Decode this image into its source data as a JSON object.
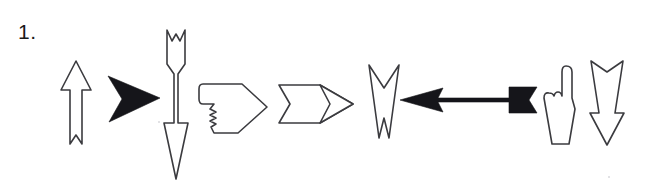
{
  "page": {
    "background_color": "#ffffff",
    "width": 649,
    "height": 188,
    "item_number": "1."
  },
  "palette": {
    "outline_stroke": "#3b3b3f",
    "fill_solid": "#15151a",
    "shape_fill": "#ffffff",
    "text_color": "#1a1a1a"
  },
  "sequence": {
    "description": "Row of nine arrow and hand symbols",
    "count": 9,
    "items": [
      {
        "index": 1,
        "icon": "arrow-up-outline-icon",
        "label": "Outlined up arrow with notched tail",
        "style": "outline",
        "direction": "up",
        "x": 55,
        "y": 58,
        "width": 44,
        "height": 92
      },
      {
        "index": 2,
        "icon": "arrowhead-right-solid-icon",
        "label": "Solid black concave arrowhead pointing right",
        "style": "solid",
        "direction": "right",
        "x": 106,
        "y": 74,
        "width": 56,
        "height": 50
      },
      {
        "index": 3,
        "icon": "arrow-down-long-fletched-outline-icon",
        "label": "Long outlined arrow pointing down with fletching",
        "style": "outline",
        "direction": "down",
        "x": 160,
        "y": 28,
        "width": 32,
        "height": 155
      },
      {
        "index": 4,
        "icon": "hand-pointing-right-icon",
        "label": "Outlined hand pointing right",
        "style": "outline",
        "direction": "right",
        "x": 197,
        "y": 80,
        "width": 72,
        "height": 57
      },
      {
        "index": 5,
        "icon": "double-chevron-right-outline-icon",
        "label": "Outlined double chevron arrow pointing right",
        "style": "outline",
        "direction": "right",
        "x": 276,
        "y": 82,
        "width": 80,
        "height": 44
      },
      {
        "index": 6,
        "icon": "arrowhead-down-outline-icon",
        "label": "Narrow outlined dart pointing down",
        "style": "outline",
        "direction": "down",
        "x": 366,
        "y": 62,
        "width": 36,
        "height": 80
      },
      {
        "index": 7,
        "icon": "arrow-left-solid-fletched-icon",
        "label": "Solid black arrow pointing left with fletched tail",
        "style": "solid",
        "direction": "left",
        "x": 399,
        "y": 85,
        "width": 140,
        "height": 30
      },
      {
        "index": 8,
        "icon": "hand-pointing-up-icon",
        "label": "Outlined hand pointing up with index finger",
        "style": "outline",
        "direction": "up",
        "x": 542,
        "y": 63,
        "width": 38,
        "height": 85
      },
      {
        "index": 9,
        "icon": "arrow-down-outline-icon",
        "label": "Outlined arrow pointing down with notched top",
        "style": "outline",
        "direction": "down",
        "x": 586,
        "y": 58,
        "width": 42,
        "height": 90
      }
    ]
  }
}
